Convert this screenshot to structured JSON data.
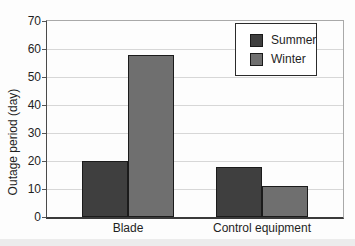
{
  "chart_data": {
    "type": "bar",
    "title": "",
    "xlabel": "",
    "ylabel": "Outage period (day)",
    "categories": [
      "Blade",
      "Control equipment"
    ],
    "series": [
      {
        "name": "Summer",
        "color": "#3f3f3f",
        "values": [
          20,
          18
        ]
      },
      {
        "name": "Winter",
        "color": "#6f6f6f",
        "values": [
          58,
          11
        ]
      }
    ],
    "ylim": [
      0,
      70
    ],
    "yticks": [
      0,
      10,
      20,
      30,
      40,
      50,
      60,
      70
    ],
    "grid": "horizontal",
    "legend_position": "top-right",
    "bar_border_color": "#1b1b1b",
    "gridline_color": "#d7d7d7"
  }
}
